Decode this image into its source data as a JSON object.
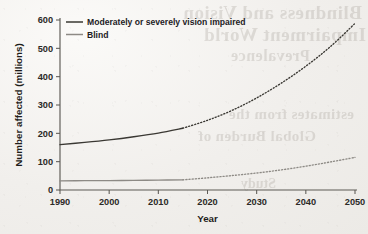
{
  "figure": {
    "background_color": "#f2f1ee",
    "ink_color": "#3a3833",
    "bleed_text": {
      "line1": "Blindness and Vision",
      "line2": "Impairment  World",
      "line3": "Prevalence",
      "line4": "estimates from the",
      "line5": "Global Burden of",
      "line6": "Study"
    }
  },
  "chart_data": {
    "type": "line",
    "title": "",
    "xlabel": "Year",
    "ylabel": "Number affected (millions)",
    "xlim": [
      1990,
      2050
    ],
    "ylim": [
      0,
      600
    ],
    "xticks": [
      1990,
      2000,
      2010,
      2020,
      2030,
      2040,
      2050
    ],
    "yticks": [
      0,
      100,
      200,
      300,
      400,
      500,
      600
    ],
    "grid": false,
    "legend_position": "top-left",
    "projection_start_year": 2015,
    "series": [
      {
        "name": "Moderately or severely vision impaired",
        "color": "#3a3833",
        "x": [
          1990,
          1995,
          2000,
          2005,
          2010,
          2015,
          2020,
          2025,
          2030,
          2035,
          2040,
          2045,
          2050
        ],
        "values": [
          160,
          168,
          177,
          188,
          201,
          218,
          246,
          281,
          325,
          377,
          437,
          506,
          588
        ],
        "observed_through": 2015
      },
      {
        "name": "Blind",
        "color": "#8d8a85",
        "x": [
          1990,
          1995,
          2000,
          2005,
          2010,
          2015,
          2020,
          2025,
          2030,
          2035,
          2040,
          2045,
          2050
        ],
        "values": [
          32,
          33,
          33,
          34,
          35,
          36,
          43,
          51,
          60,
          71,
          84,
          99,
          115
        ],
        "observed_through": 2015
      }
    ]
  }
}
